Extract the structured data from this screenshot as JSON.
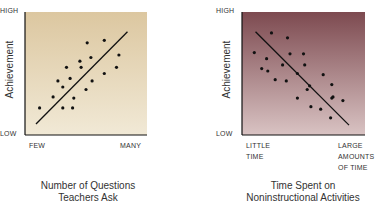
{
  "chart_data": [
    {
      "type": "scatter",
      "title": "Number of Questions Teachers Ask",
      "title_lines": [
        "Number of Questions",
        "Teachers Ask"
      ],
      "xlabel": "Number of Questions Teachers Ask",
      "ylabel": "Achievement",
      "x_tick_labels": [
        "FEW",
        "MANY"
      ],
      "y_tick_labels": [
        "LOW",
        "HIGH"
      ],
      "trend": "positive",
      "background": "#e6d7b8",
      "grid": false,
      "xlim": [
        0,
        100
      ],
      "ylim": [
        0,
        100
      ],
      "points": [
        [
          12,
          22
        ],
        [
          23,
          31
        ],
        [
          27,
          44
        ],
        [
          31,
          39
        ],
        [
          34,
          55
        ],
        [
          37,
          46
        ],
        [
          40,
          30
        ],
        [
          31,
          22
        ],
        [
          39,
          22
        ],
        [
          45,
          60
        ],
        [
          46,
          55
        ],
        [
          51,
          75
        ],
        [
          54,
          63
        ],
        [
          55,
          44
        ],
        [
          50,
          37
        ],
        [
          65,
          77
        ],
        [
          65,
          50
        ],
        [
          75,
          55
        ],
        [
          77,
          65
        ]
      ],
      "trendline": [
        [
          9,
          9
        ],
        [
          84,
          84
        ]
      ]
    },
    {
      "type": "scatter",
      "title": "Time Spent on Noninstructional Activities",
      "title_lines": [
        "Time Spent on",
        "Noninstructional Activities"
      ],
      "xlabel": "Time Spent on Noninstructional Activities",
      "ylabel": "Achievement",
      "x_tick_labels": [
        "LITTLE TIME",
        "LARGE AMOUNTS OF TIME"
      ],
      "y_tick_labels": [
        "LOW",
        "HIGH"
      ],
      "trend": "negative",
      "background": "#8a5a5e",
      "grid": false,
      "xlim": [
        0,
        100
      ],
      "ylim": [
        0,
        100
      ],
      "points": [
        [
          10,
          67
        ],
        [
          24,
          83
        ],
        [
          37,
          79
        ],
        [
          39,
          66
        ],
        [
          50,
          66
        ],
        [
          51,
          57
        ],
        [
          20,
          62
        ],
        [
          16,
          54
        ],
        [
          21,
          52
        ],
        [
          27,
          45
        ],
        [
          36,
          44
        ],
        [
          45,
          50
        ],
        [
          45,
          30
        ],
        [
          53,
          37
        ],
        [
          66,
          49
        ],
        [
          73,
          41
        ],
        [
          74,
          31
        ],
        [
          72,
          14
        ],
        [
          64,
          21
        ],
        [
          56,
          23
        ],
        [
          82,
          28
        ],
        [
          73,
          30
        ],
        [
          55,
          40
        ],
        [
          33,
          57
        ]
      ],
      "trendline": [
        [
          11,
          84
        ],
        [
          87,
          8
        ]
      ]
    }
  ],
  "labels": {
    "left": {
      "high": "HIGH",
      "low": "LOW",
      "ylabel": "Achievement",
      "x_low": "FEW",
      "x_high": "MANY",
      "title1": "Number of Questions",
      "title2": "Teachers Ask"
    },
    "right": {
      "high": "HIGH",
      "low": "LOW",
      "ylabel": "Achievement",
      "x_low1": "LITTLE",
      "x_low2": "TIME",
      "x_high1": "LARGE",
      "x_high2": "AMOUNTS",
      "x_high3": "OF TIME",
      "title1": "Time Spent on",
      "title2": "Noninstructional Activities"
    }
  }
}
